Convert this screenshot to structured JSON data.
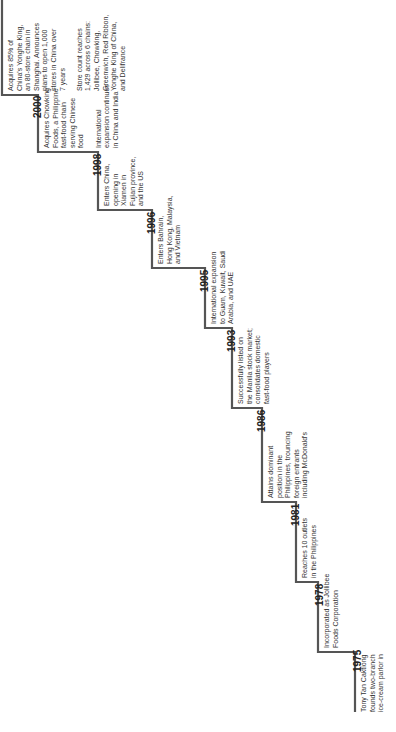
{
  "diagram": {
    "type": "staircase-timeline",
    "orientation": "rotated-90-ccw",
    "line_color": "#555555",
    "milestones": [
      {
        "year": "1975",
        "text": "Tony Tan Caktiong\nfounds two-branch\nice-cream parlor in"
      },
      {
        "year": "1978",
        "text": "Incorporated as Jollibee\nFoods Corporation"
      },
      {
        "year": "1981",
        "text": "Reaches 10 outlets\nin the Philippines"
      },
      {
        "year": "1986",
        "text": "Attains dominant\nposition in the\nPhilippines, trouncing\nforeign entrants\nincluding McDonald's"
      },
      {
        "year": "1993",
        "text": "Successfully listed on\nthe Manila stock market;\nconsolidates domestic\nfast-food players"
      },
      {
        "year": "1995",
        "text": "International expansion\nto Guam, Kuwait, Saudi\nArabia, and UAE"
      },
      {
        "year": "1996",
        "text": "Enters Bahrain,\nHong Kong, Malaysia,\nand Vietnam"
      },
      {
        "year": "1998",
        "text": "Enters China,\nopening in\nXiamen in\nFujian province,\nand the US"
      },
      {
        "year": "2000",
        "text": "Acquires Chowking\nFoods, a Philippine\nfast-food chain\nserving Chinese\nfood\n\nInternational\nexpansion continues\nin China and India"
      },
      {
        "year": "",
        "text": "Acquires 85% of\nChina's Yonghe King,\nan 80-store chain in\nShanghai. Announces\nplans to open 1,000\nstores in China over\n7 years\n\nStore count reaches\n1,429 across 6 chains:\nJollibee, Chowking,\nGreenwich, Red Ribbon,\nYonghe King of China,\nand Delifrance"
      }
    ]
  }
}
